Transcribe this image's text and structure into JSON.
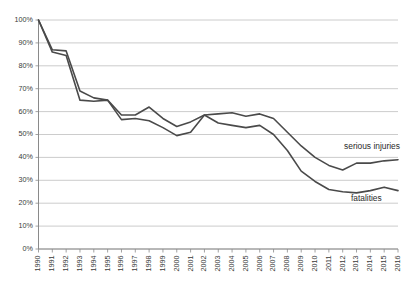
{
  "chart_data": {
    "type": "line",
    "title": "",
    "subtitle": "",
    "xlabel": "",
    "ylabel": "",
    "xlim": [
      1990,
      2016
    ],
    "ylim": [
      0,
      100
    ],
    "grid": true,
    "legend_position": "inline-annotation",
    "y_tick_labels": [
      "100%",
      "90%",
      "80%",
      "70%",
      "60%",
      "50%",
      "40%",
      "30%",
      "20%",
      "10%",
      "0%"
    ],
    "y_tick_values": [
      100,
      90,
      80,
      70,
      60,
      50,
      40,
      30,
      20,
      10,
      0
    ],
    "categories": [
      "1990",
      "1991",
      "1992",
      "1993",
      "1994",
      "1995",
      "1996",
      "1997",
      "1998",
      "1999",
      "2000",
      "2001",
      "2002",
      "2003",
      "2004",
      "2005",
      "2006",
      "2007",
      "2008",
      "2009",
      "2010",
      "2011",
      "2012",
      "2013",
      "2014",
      "2015",
      "2016"
    ],
    "series": [
      {
        "name": "serious injuries",
        "annotation": "serious injuries",
        "color": "#4a4a4a",
        "values": [
          100,
          87,
          86.5,
          69,
          66,
          65,
          58.5,
          58.5,
          62,
          57,
          53.5,
          55.5,
          58.5,
          59,
          59.5,
          58,
          59,
          57,
          51,
          45,
          40,
          36.5,
          34.5,
          37.5,
          37.5,
          38.5,
          39
        ]
      },
      {
        "name": "fatalities",
        "annotation": "fatalities",
        "color": "#4a4a4a",
        "values": [
          100,
          86,
          84.5,
          65,
          64.5,
          65,
          56.5,
          57,
          56,
          53,
          49.5,
          51,
          58.5,
          55,
          54,
          53,
          54,
          50,
          43,
          34,
          29.5,
          26,
          25,
          24.5,
          25.5,
          27,
          25.5
        ]
      }
    ],
    "annotations": [
      {
        "text": "serious injuries",
        "x": 2012.1,
        "y": 43.5
      },
      {
        "text": "fatalities",
        "x": 2012.6,
        "y": 21.0
      }
    ]
  }
}
